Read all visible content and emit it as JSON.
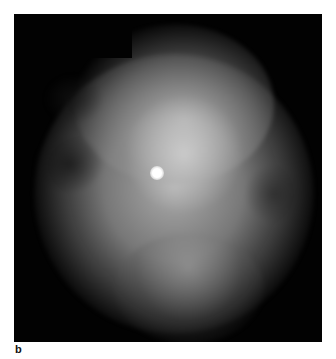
{
  "figure": {
    "panel_label": "b",
    "colors": {
      "background": "#020202",
      "page": "#ffffff"
    }
  }
}
